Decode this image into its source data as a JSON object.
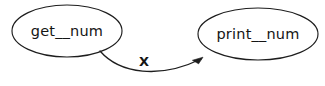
{
  "diagram": {
    "type": "call-graph",
    "background_color": "#ffffff",
    "stroke_color": "#1d1d1d",
    "text_color": "#151515",
    "nodes": [
      {
        "id": "get_num",
        "label": "get__num",
        "shape": "ellipse",
        "cx": 67,
        "cy": 31,
        "rx": 55,
        "ry": 26
      },
      {
        "id": "print_num",
        "label": "print__num",
        "shape": "ellipse",
        "cx": 258,
        "cy": 34,
        "rx": 60,
        "ry": 26
      }
    ],
    "edges": [
      {
        "id": "get_num-to-print_num",
        "from": "get_num",
        "to": "print_num",
        "label": "X",
        "label_x": 144,
        "label_y": 62,
        "directed": true,
        "curve": "M 100,51 C 120,74 160,79 201,59"
      }
    ]
  }
}
